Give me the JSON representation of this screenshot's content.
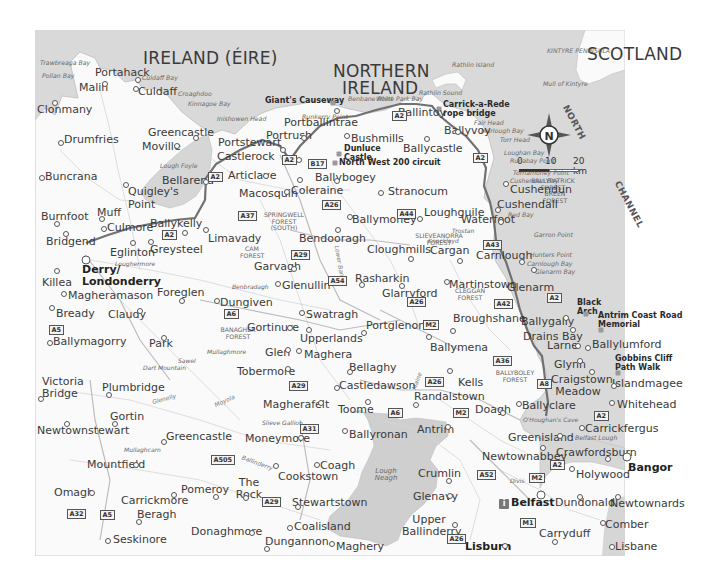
{
  "map": {
    "colors": {
      "sea": "#d9d9d9",
      "land": "#fafafa",
      "lake": "#cccccc",
      "route": "#6e6e6e",
      "road": "#cfcfcf"
    },
    "countries": [
      {
        "id": "ireland",
        "label": "IRELAND (ÉIRE)"
      },
      {
        "id": "northern-ireland-1",
        "label": "NORTHERN"
      },
      {
        "id": "northern-ireland-2",
        "label": "IRELAND"
      },
      {
        "id": "scotland",
        "label": "SCOTLAND"
      }
    ],
    "sea_labels": [
      {
        "id": "north",
        "label": "NORTH"
      },
      {
        "id": "channel",
        "label": "CHANNEL"
      }
    ],
    "towns": [
      {
        "id": "portahack",
        "label": "Portahack"
      },
      {
        "id": "malin",
        "label": "Malin"
      },
      {
        "id": "culdaff",
        "label": "Culdaff"
      },
      {
        "id": "clonmany",
        "label": "Clonmany"
      },
      {
        "id": "drumfries",
        "label": "Drumfries"
      },
      {
        "id": "greencastle-n",
        "label": "Greencastle"
      },
      {
        "id": "moville",
        "label": "Moville"
      },
      {
        "id": "buncrana",
        "label": "Buncrana"
      },
      {
        "id": "bellarena",
        "label": "Bellarena"
      },
      {
        "id": "quigleys-point",
        "label": "Quigley's Point"
      },
      {
        "id": "burnfoot",
        "label": "Burnfoot"
      },
      {
        "id": "muff",
        "label": "Muff"
      },
      {
        "id": "culmore",
        "label": "Culmore"
      },
      {
        "id": "ballykelly",
        "label": "Ballykelly"
      },
      {
        "id": "bridgend",
        "label": "Bridgend"
      },
      {
        "id": "eglinton",
        "label": "Eglinton"
      },
      {
        "id": "greysteel",
        "label": "Greysteel"
      },
      {
        "id": "limavady",
        "label": "Limavady"
      },
      {
        "id": "derry",
        "label": "Derry/ Londonderry"
      },
      {
        "id": "killea",
        "label": "Killea"
      },
      {
        "id": "magheramason",
        "label": "Magheramason"
      },
      {
        "id": "foreglen",
        "label": "Foreglen"
      },
      {
        "id": "bready",
        "label": "Bready"
      },
      {
        "id": "claudy",
        "label": "Claudy"
      },
      {
        "id": "dungiven",
        "label": "Dungiven"
      },
      {
        "id": "ballymagorry",
        "label": "Ballymagorry"
      },
      {
        "id": "park",
        "label": "Park"
      },
      {
        "id": "victoria-bridge",
        "label": "Victoria Bridge"
      },
      {
        "id": "plumbridge",
        "label": "Plumbridge"
      },
      {
        "id": "gortin",
        "label": "Gortin"
      },
      {
        "id": "newtownstewart",
        "label": "Newtownstewart"
      },
      {
        "id": "greencastle-s",
        "label": "Greencastle"
      },
      {
        "id": "mountfield",
        "label": "Mountfield"
      },
      {
        "id": "omagh",
        "label": "Omagh"
      },
      {
        "id": "carrickmore",
        "label": "Carrickmore"
      },
      {
        "id": "pomeroy",
        "label": "Pomeroy"
      },
      {
        "id": "beragh",
        "label": "Beragh"
      },
      {
        "id": "seskinore",
        "label": "Seskinore"
      },
      {
        "id": "donaghmore",
        "label": "Donaghmore"
      },
      {
        "id": "portstewart",
        "label": "Portstewart"
      },
      {
        "id": "castlerock",
        "label": "Castlerock"
      },
      {
        "id": "portrush",
        "label": "Portrush"
      },
      {
        "id": "portballintrae",
        "label": "Portballintrae"
      },
      {
        "id": "articlave",
        "label": "Articlave"
      },
      {
        "id": "bushmills",
        "label": "Bushmills"
      },
      {
        "id": "ballybogey",
        "label": "Ballybogey"
      },
      {
        "id": "coleraine",
        "label": "Coleraine"
      },
      {
        "id": "macosquin",
        "label": "Macosquin"
      },
      {
        "id": "ballintoy",
        "label": "Ballintoy"
      },
      {
        "id": "ballyvoy",
        "label": "Ballyvoy"
      },
      {
        "id": "ballycastle",
        "label": "Ballycastle"
      },
      {
        "id": "stranocum",
        "label": "Stranocum"
      },
      {
        "id": "cushendun",
        "label": "Cushendun"
      },
      {
        "id": "cushendall",
        "label": "Cushendall"
      },
      {
        "id": "waterfoot",
        "label": "Waterfoot"
      },
      {
        "id": "loughguile",
        "label": "Loughguile"
      },
      {
        "id": "ballymoney",
        "label": "Ballymoney"
      },
      {
        "id": "bendooragh",
        "label": "Bendooragh"
      },
      {
        "id": "cloughmills",
        "label": "Cloughmills"
      },
      {
        "id": "cargan",
        "label": "Cargan"
      },
      {
        "id": "carnlough",
        "label": "Carnlough"
      },
      {
        "id": "garvagh",
        "label": "Garvagh"
      },
      {
        "id": "glenullin",
        "label": "Glenullin"
      },
      {
        "id": "rasharkin",
        "label": "Rasharkin"
      },
      {
        "id": "glarryford",
        "label": "Glarryford"
      },
      {
        "id": "martinstown",
        "label": "Martinstown"
      },
      {
        "id": "glenarm",
        "label": "Glenarm"
      },
      {
        "id": "swatragh",
        "label": "Swatragh"
      },
      {
        "id": "gortinure",
        "label": "Gortinure"
      },
      {
        "id": "upperlands",
        "label": "Upperlands"
      },
      {
        "id": "portglenone",
        "label": "Portglenone"
      },
      {
        "id": "broughshane",
        "label": "Broughshane"
      },
      {
        "id": "ballygally",
        "label": "Ballygally"
      },
      {
        "id": "drains-bay",
        "label": "Drains Bay"
      },
      {
        "id": "glen",
        "label": "Glen"
      },
      {
        "id": "maghera",
        "label": "Maghera"
      },
      {
        "id": "ballymena",
        "label": "Ballymena"
      },
      {
        "id": "larne",
        "label": "Larne"
      },
      {
        "id": "ballylumford",
        "label": "Ballylumford"
      },
      {
        "id": "tobermore",
        "label": "Tobermore"
      },
      {
        "id": "bellaghy",
        "label": "Bellaghy"
      },
      {
        "id": "glynn",
        "label": "Glynn"
      },
      {
        "id": "castledawson",
        "label": "Castledawson"
      },
      {
        "id": "kells",
        "label": "Kells"
      },
      {
        "id": "craigstown-meadow",
        "label": "Craigstown Meadow"
      },
      {
        "id": "islandmagee",
        "label": "Islandmagee"
      },
      {
        "id": "magherafelt",
        "label": "Magherafelt"
      },
      {
        "id": "toome",
        "label": "Toome"
      },
      {
        "id": "randalstown",
        "label": "Randalstown"
      },
      {
        "id": "doagh",
        "label": "Doagh"
      },
      {
        "id": "ballyclare",
        "label": "Ballyclare"
      },
      {
        "id": "whitehead",
        "label": "Whitehead"
      },
      {
        "id": "moneymore",
        "label": "Moneymore"
      },
      {
        "id": "ballyronan",
        "label": "Ballyronan"
      },
      {
        "id": "antrim",
        "label": "Antrim"
      },
      {
        "id": "greenisland",
        "label": "Greenisland"
      },
      {
        "id": "carrickfergus",
        "label": "Carrickfergus"
      },
      {
        "id": "newtownabbey",
        "label": "Newtownabbey"
      },
      {
        "id": "crawfordsburn",
        "label": "Crawfordsburn"
      },
      {
        "id": "bangor",
        "label": "Bangor"
      },
      {
        "id": "coagh",
        "label": "Coagh"
      },
      {
        "id": "cookstown",
        "label": "Cookstown"
      },
      {
        "id": "crumlin",
        "label": "Crumlin"
      },
      {
        "id": "holywood",
        "label": "Holywood"
      },
      {
        "id": "the-rock",
        "label": "The Rock"
      },
      {
        "id": "stewartstown",
        "label": "Stewartstown"
      },
      {
        "id": "glenavy",
        "label": "Glenavy"
      },
      {
        "id": "belfast",
        "label": "Belfast"
      },
      {
        "id": "dundonald",
        "label": "Dundonald"
      },
      {
        "id": "newtownards",
        "label": "Newtownards"
      },
      {
        "id": "upper-ballinderry",
        "label": "Upper Ballinderry"
      },
      {
        "id": "comber",
        "label": "Comber"
      },
      {
        "id": "coalisland",
        "label": "Coalisland"
      },
      {
        "id": "dungannon",
        "label": "Dungannon"
      },
      {
        "id": "maghery",
        "label": "Maghery"
      },
      {
        "id": "lisburn",
        "label": "Lisburn"
      },
      {
        "id": "carryduff",
        "label": "Carryduff"
      },
      {
        "id": "lisbane",
        "label": "Lisbane"
      }
    ],
    "features": [
      {
        "id": "trawbreaga-bay",
        "label": "Trawbreaga Bay"
      },
      {
        "id": "pollan-bay",
        "label": "Pollan Bay"
      },
      {
        "id": "culdaff-bay",
        "label": "Culdaff Bay"
      },
      {
        "id": "croaghdoo",
        "label": "Croaghdoo"
      },
      {
        "id": "kinnagoe-bay",
        "label": "Kinnagoe Bay"
      },
      {
        "id": "inishowen-head",
        "label": "Inishowen Head"
      },
      {
        "id": "lough-foyle",
        "label": "Lough Foyle"
      },
      {
        "id": "runkerry-point",
        "label": "Runkerry Point"
      },
      {
        "id": "benbane-point",
        "label": "Benbane Point"
      },
      {
        "id": "white-park-bay",
        "label": "White Park Bay"
      },
      {
        "id": "rathlin-sound",
        "label": "Rathlin Sound"
      },
      {
        "id": "rathlin-island",
        "label": "Rathlin Island"
      },
      {
        "id": "kintyre-peninsula",
        "label": "KINTYRE PENINSULA"
      },
      {
        "id": "mull-of-kintyre",
        "label": "Mull of Kintyre"
      },
      {
        "id": "fair-head",
        "label": "Fair Head"
      },
      {
        "id": "murlough-bay",
        "label": "Murlough Bay"
      },
      {
        "id": "torr-head",
        "label": "Torr Head"
      },
      {
        "id": "loughan-bay",
        "label": "Loughan Bay"
      },
      {
        "id": "runabay-point",
        "label": "Runabay Point"
      },
      {
        "id": "tornamoney-point",
        "label": "Tornamoney Point"
      },
      {
        "id": "cushendun-bay",
        "label": "Cushendun Bay"
      },
      {
        "id": "red-bay",
        "label": "Red Bay"
      },
      {
        "id": "garron-point",
        "label": "Garron Point"
      },
      {
        "id": "hunters-point",
        "label": "Hunters Point"
      },
      {
        "id": "carnlough-bay",
        "label": "Carnlough Bay"
      },
      {
        "id": "glenarm-bay",
        "label": "Glenarm Bay"
      },
      {
        "id": "belfast-lough",
        "label": "Belfast Lough"
      },
      {
        "id": "lough-neagh",
        "label": "Lough Neagh"
      }
    ],
    "forests": [
      {
        "id": "springwell",
        "label": "SPRINGWELL FOREST (SOUTH)"
      },
      {
        "id": "cam",
        "label": "CAM FOREST"
      },
      {
        "id": "ballypatrick",
        "label": "BALLYPATRICK FOREST"
      },
      {
        "id": "breen",
        "label": "BREEN FOREST"
      },
      {
        "id": "slieveanorra",
        "label": "SLIEVEANORRA FOREST"
      },
      {
        "id": "cleggan",
        "label": "CLEGGAN FOREST"
      },
      {
        "id": "banagher",
        "label": "BANAGHER FOREST"
      },
      {
        "id": "ballyboley",
        "label": "BALLYBOLEY FOREST"
      }
    ],
    "peaks": [
      {
        "id": "knocklayd",
        "label": "Knocklayd"
      },
      {
        "id": "loughermore",
        "label": "Loughermore"
      },
      {
        "id": "benbradagh",
        "label": "Benbradagh"
      },
      {
        "id": "sawel",
        "label": "Sawel"
      },
      {
        "id": "dart-mountain",
        "label": "Dart Mountain"
      },
      {
        "id": "mullaghmore",
        "label": "Mullaghmore"
      },
      {
        "id": "mullaghcarn",
        "label": "Mullaghcarn"
      },
      {
        "id": "slieve-gallion",
        "label": "Slieve Gallion"
      },
      {
        "id": "trostan",
        "label": "Trostan"
      },
      {
        "id": "divis",
        "label": "Divis"
      },
      {
        "id": "ohoughans-cave",
        "label": "O'Houghan's Cave"
      }
    ],
    "rivers": [
      {
        "id": "lower-bann",
        "label": "Lower Bann"
      },
      {
        "id": "glenelly",
        "label": "Glenelly"
      },
      {
        "id": "moyola",
        "label": "Moyola"
      },
      {
        "id": "maine",
        "label": "Maine"
      },
      {
        "id": "ballinderry",
        "label": "Ballinderry"
      }
    ],
    "roads": [
      "A2",
      "B17",
      "A26",
      "A37",
      "A29",
      "A44",
      "A54",
      "A6",
      "A5",
      "A43",
      "A42",
      "A36",
      "M2",
      "A8",
      "A31",
      "A505",
      "A32",
      "A52",
      "M1"
    ],
    "pois": [
      {
        "id": "giants-causeway",
        "label": "Giant's Causeway"
      },
      {
        "id": "dunluce-castle",
        "label": "Dunluce Castle"
      },
      {
        "id": "nw200",
        "label": "North West 200 circuit"
      },
      {
        "id": "carrick-a-rede",
        "label": "Carrick-a-Rede rope bridge"
      },
      {
        "id": "black-arch",
        "label": "Black Arch"
      },
      {
        "id": "antrim-coast-road",
        "label": "Antrim Coast Road Memorial"
      },
      {
        "id": "gobbins",
        "label": "Gobbins Cliff Path Walk"
      }
    ],
    "compass": {
      "label": "N",
      "icon": "compass-rose-icon"
    },
    "scale": {
      "ticks": [
        "0",
        "10",
        "20 km"
      ]
    },
    "info_icon": {
      "label": "i",
      "icon": "tourist-info-icon"
    }
  }
}
